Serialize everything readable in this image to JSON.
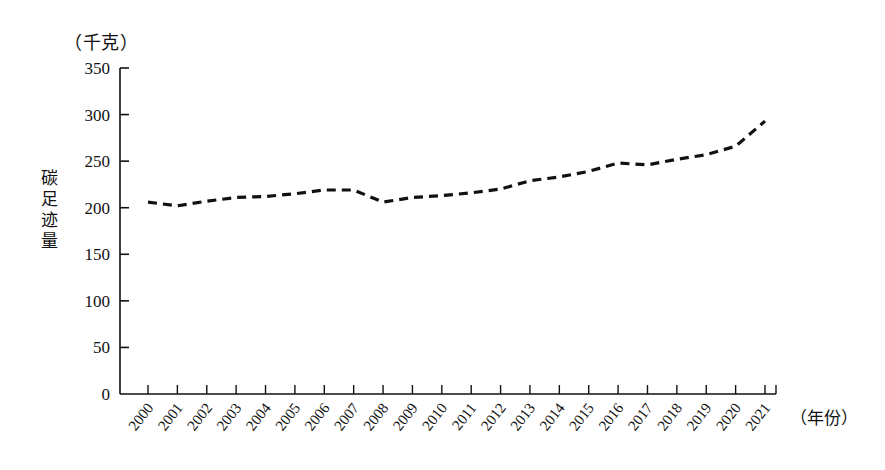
{
  "chart_data": {
    "type": "line",
    "title": "",
    "xlabel": "（年份）",
    "ylabel": "碳足迹量",
    "unit_label": "（千克）",
    "ylim": [
      0,
      350
    ],
    "yticks": [
      0,
      50,
      100,
      150,
      200,
      250,
      300,
      350
    ],
    "grid": false,
    "legend": null,
    "line_style": "dashed",
    "line_color": "#111111",
    "categories": [
      "2000",
      "2001",
      "2002",
      "2003",
      "2004",
      "2005",
      "2006",
      "2007",
      "2008",
      "2009",
      "2010",
      "2011",
      "2012",
      "2013",
      "2014",
      "2015",
      "2016",
      "2017",
      "2018",
      "2019",
      "2020",
      "2021"
    ],
    "values": [
      206,
      202,
      207,
      211,
      212,
      215,
      219,
      219,
      206,
      211,
      213,
      216,
      220,
      229,
      233,
      239,
      248,
      246,
      252,
      257,
      266,
      293
    ]
  },
  "axis": {
    "unit_label": "（千克）",
    "y_title_chars": [
      "碳",
      "足",
      "迹",
      "量"
    ],
    "x_unit_label": "（年份）"
  }
}
